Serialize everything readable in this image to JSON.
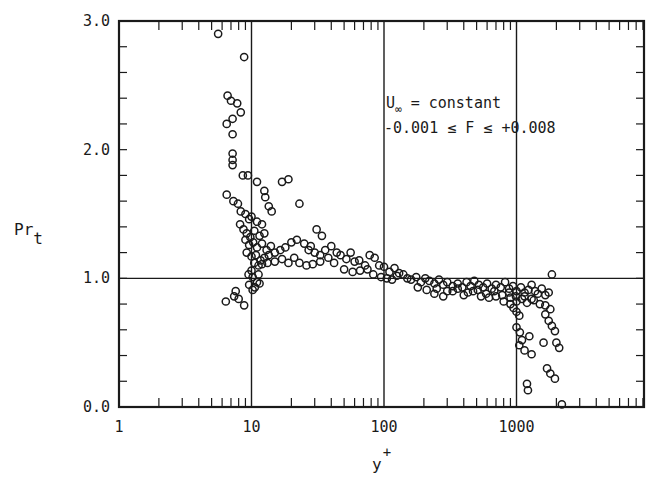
{
  "chart_data": {
    "type": "scatter",
    "title": "",
    "xlabel": "y+",
    "xlabel_main": "y",
    "xlabel_sup": "+",
    "ylabel": "Pr_t",
    "ylabel_main": "Pr",
    "ylabel_sub": "t",
    "xscale": "log",
    "xlim": [
      1,
      9000
    ],
    "ylim": [
      0.0,
      3.0
    ],
    "x_tick_labels": [
      "1",
      "10",
      "100",
      "1000"
    ],
    "x_ticks": [
      1,
      10,
      100,
      1000
    ],
    "y_tick_labels": [
      "0.0",
      "1.0",
      "2.0",
      "3.0"
    ],
    "y_ticks": [
      0.0,
      1.0,
      2.0,
      3.0
    ],
    "grid": "major lines at x=10,100,1000 and y=1.0",
    "marker": "open circle",
    "annotation": {
      "line1_main": "U",
      "line1_sub": "∞",
      "line1_rest": " = constant",
      "line2": "-0.001 ≤ F ≤ +0.008"
    },
    "series": [
      {
        "name": "Pr_t data",
        "points": [
          [
            5.6,
            2.9
          ],
          [
            6.6,
            2.42
          ],
          [
            7.0,
            2.38
          ],
          [
            7.8,
            2.36
          ],
          [
            8.3,
            2.29
          ],
          [
            7.2,
            2.24
          ],
          [
            6.5,
            2.2
          ],
          [
            7.2,
            2.12
          ],
          [
            7.2,
            1.97
          ],
          [
            7.2,
            1.92
          ],
          [
            7.2,
            1.88
          ],
          [
            8.8,
            2.72
          ],
          [
            8.6,
            1.8
          ],
          [
            9.4,
            1.8
          ],
          [
            11.0,
            1.75
          ],
          [
            6.5,
            1.65
          ],
          [
            7.3,
            1.6
          ],
          [
            7.9,
            1.58
          ],
          [
            8.3,
            1.52
          ],
          [
            9.0,
            1.5
          ],
          [
            9.6,
            1.46
          ],
          [
            10.0,
            1.48
          ],
          [
            11.0,
            1.44
          ],
          [
            12.0,
            1.42
          ],
          [
            12.5,
            1.68
          ],
          [
            12.7,
            1.63
          ],
          [
            13.5,
            1.56
          ],
          [
            14.2,
            1.52
          ],
          [
            17.0,
            1.75
          ],
          [
            19.0,
            1.77
          ],
          [
            23.0,
            1.58
          ],
          [
            8.2,
            1.42
          ],
          [
            8.7,
            1.38
          ],
          [
            9.2,
            1.35
          ],
          [
            9.8,
            1.32
          ],
          [
            10.5,
            1.37
          ],
          [
            11.5,
            1.33
          ],
          [
            12.5,
            1.35
          ],
          [
            9.0,
            1.3
          ],
          [
            9.6,
            1.26
          ],
          [
            10.3,
            1.28
          ],
          [
            11.0,
            1.24
          ],
          [
            12.0,
            1.27
          ],
          [
            13.0,
            1.22
          ],
          [
            14.0,
            1.25
          ],
          [
            9.2,
            1.2
          ],
          [
            10.0,
            1.17
          ],
          [
            10.8,
            1.18
          ],
          [
            11.7,
            1.14
          ],
          [
            12.5,
            1.16
          ],
          [
            13.5,
            1.18
          ],
          [
            15.0,
            1.2
          ],
          [
            16.5,
            1.22
          ],
          [
            18.0,
            1.24
          ],
          [
            20.0,
            1.28
          ],
          [
            22.0,
            1.3
          ],
          [
            25.0,
            1.27
          ],
          [
            28.0,
            1.25
          ],
          [
            31.0,
            1.38
          ],
          [
            34.0,
            1.33
          ],
          [
            27.0,
            1.22
          ],
          [
            30.0,
            1.2
          ],
          [
            33.0,
            1.18
          ],
          [
            36.0,
            1.22
          ],
          [
            40.0,
            1.25
          ],
          [
            44.0,
            1.2
          ],
          [
            10.5,
            1.12
          ],
          [
            11.3,
            1.1
          ],
          [
            12.0,
            1.11
          ],
          [
            13.2,
            1.12
          ],
          [
            15.0,
            1.13
          ],
          [
            17.0,
            1.15
          ],
          [
            19.0,
            1.12
          ],
          [
            21.0,
            1.16
          ],
          [
            23.0,
            1.12
          ],
          [
            26.0,
            1.1
          ],
          [
            29.0,
            1.11
          ],
          [
            33.0,
            1.13
          ],
          [
            38.0,
            1.16
          ],
          [
            42.0,
            1.12
          ],
          [
            47.0,
            1.18
          ],
          [
            52.0,
            1.15
          ],
          [
            56.0,
            1.2
          ],
          [
            60.0,
            1.13
          ],
          [
            65.0,
            1.14
          ],
          [
            72.0,
            1.1
          ],
          [
            78.0,
            1.18
          ],
          [
            85.0,
            1.16
          ],
          [
            92.0,
            1.1
          ],
          [
            100.0,
            1.09
          ],
          [
            110.0,
            1.05
          ],
          [
            120.0,
            1.08
          ],
          [
            130.0,
            1.04
          ],
          [
            140.0,
            1.03
          ],
          [
            50.0,
            1.07
          ],
          [
            58.0,
            1.05
          ],
          [
            66.0,
            1.06
          ],
          [
            75.0,
            1.07
          ],
          [
            83.0,
            1.03
          ],
          [
            95.0,
            1.01
          ],
          [
            105.0,
            1.0
          ],
          [
            115.0,
            0.99
          ],
          [
            125.0,
            1.02
          ],
          [
            150.0,
            1.0
          ],
          [
            160.0,
            0.99
          ],
          [
            175.0,
            1.01
          ],
          [
            190.0,
            0.97
          ],
          [
            205.0,
            1.0
          ],
          [
            220.0,
            0.98
          ],
          [
            240.0,
            0.96
          ],
          [
            260.0,
            0.99
          ],
          [
            280.0,
            0.95
          ],
          [
            300.0,
            0.97
          ],
          [
            330.0,
            0.94
          ],
          [
            360.0,
            0.96
          ],
          [
            390.0,
            0.93
          ],
          [
            420.0,
            0.97
          ],
          [
            450.0,
            0.94
          ],
          [
            480.0,
            0.98
          ],
          [
            520.0,
            0.95
          ],
          [
            560.0,
            0.93
          ],
          [
            600.0,
            0.96
          ],
          [
            650.0,
            0.92
          ],
          [
            700.0,
            0.95
          ],
          [
            760.0,
            0.93
          ],
          [
            820.0,
            0.97
          ],
          [
            880.0,
            0.92
          ],
          [
            940.0,
            0.94
          ],
          [
            1000.0,
            0.9
          ],
          [
            1080.0,
            0.93
          ],
          [
            1150.0,
            0.89
          ],
          [
            1230.0,
            0.91
          ],
          [
            1300.0,
            0.95
          ],
          [
            1380.0,
            0.9
          ],
          [
            1450.0,
            0.88
          ],
          [
            1550.0,
            0.92
          ],
          [
            1650.0,
            0.87
          ],
          [
            1750.0,
            0.89
          ],
          [
            1850.0,
            1.03
          ],
          [
            240.0,
            0.88
          ],
          [
            280.0,
            0.86
          ],
          [
            330.0,
            0.9
          ],
          [
            400.0,
            0.87
          ],
          [
            470.0,
            0.9
          ],
          [
            540.0,
            0.86
          ],
          [
            620.0,
            0.85
          ],
          [
            700.0,
            0.86
          ],
          [
            800.0,
            0.82
          ],
          [
            900.0,
            0.85
          ],
          [
            1000.0,
            0.82
          ],
          [
            1100.0,
            0.84
          ],
          [
            1200.0,
            0.81
          ],
          [
            1350.0,
            0.83
          ],
          [
            1500.0,
            0.8
          ],
          [
            1650.0,
            0.79
          ],
          [
            1800.0,
            0.76
          ],
          [
            180.0,
            0.93
          ],
          [
            210.0,
            0.91
          ],
          [
            250.0,
            0.92
          ],
          [
            300.0,
            0.9
          ],
          [
            360.0,
            0.92
          ],
          [
            430.0,
            0.89
          ],
          [
            510.0,
            0.91
          ],
          [
            590.0,
            0.88
          ],
          [
            680.0,
            0.9
          ],
          [
            780.0,
            0.87
          ],
          [
            880.0,
            0.89
          ],
          [
            990.0,
            0.86
          ],
          [
            1150.0,
            0.86
          ],
          [
            1300.0,
            0.84
          ],
          [
            900.0,
            0.8
          ],
          [
            950.0,
            0.77
          ],
          [
            1000.0,
            0.74
          ],
          [
            1050.0,
            0.71
          ],
          [
            1000.0,
            0.62
          ],
          [
            1060.0,
            0.58
          ],
          [
            1050.0,
            0.48
          ],
          [
            1100.0,
            0.52
          ],
          [
            1150.0,
            0.44
          ],
          [
            1250.0,
            0.55
          ],
          [
            1300.0,
            0.41
          ],
          [
            1200.0,
            0.18
          ],
          [
            1220.0,
            0.13
          ],
          [
            1650.0,
            0.72
          ],
          [
            1750.0,
            0.67
          ],
          [
            1850.0,
            0.63
          ],
          [
            1950.0,
            0.59
          ],
          [
            1600.0,
            0.5
          ],
          [
            2000.0,
            0.5
          ],
          [
            2100.0,
            0.46
          ],
          [
            1700.0,
            0.3
          ],
          [
            1800.0,
            0.26
          ],
          [
            1950.0,
            0.22
          ],
          [
            2200.0,
            0.02
          ],
          [
            6.4,
            0.82
          ],
          [
            7.4,
            0.86
          ],
          [
            7.6,
            0.9
          ],
          [
            8.0,
            0.84
          ],
          [
            8.8,
            0.79
          ],
          [
            9.6,
            0.95
          ],
          [
            10.2,
            0.91
          ],
          [
            10.6,
            0.93
          ],
          [
            11.0,
            0.97
          ],
          [
            11.5,
            0.96
          ],
          [
            9.5,
            1.03
          ],
          [
            10.0,
            1.06
          ],
          [
            10.2,
            1.01
          ],
          [
            11.3,
            1.03
          ]
        ]
      }
    ]
  }
}
